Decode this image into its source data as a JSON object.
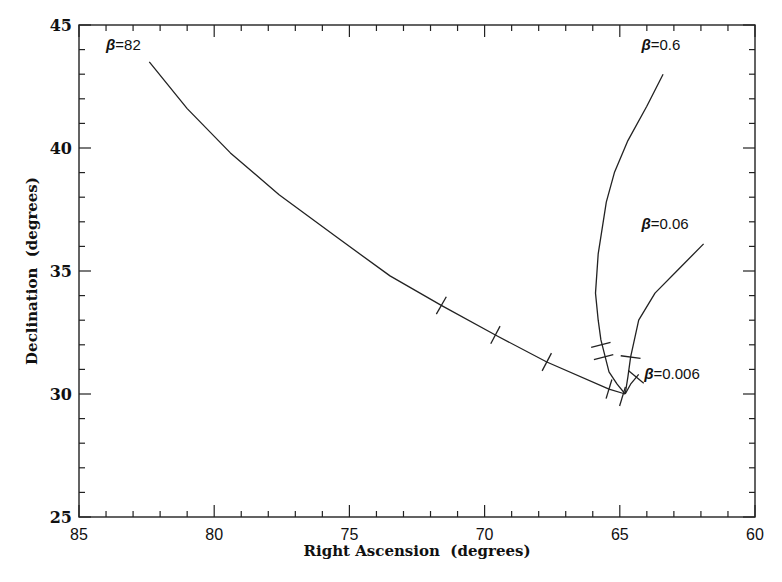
{
  "chart_data": {
    "type": "line",
    "title": "",
    "xlabel": "Right Ascension  (degrees)",
    "ylabel": "Declination  (degrees)",
    "xlim": [
      85,
      60
    ],
    "ylim": [
      25,
      45
    ],
    "x_reversed": true,
    "grid": false,
    "legend": "none (curves labeled inline)",
    "x_ticks": [
      85,
      80,
      75,
      70,
      65,
      60
    ],
    "x_tick_labels": [
      "85",
      "80",
      "75",
      "70",
      "65",
      "60"
    ],
    "y_ticks": [
      25,
      30,
      35,
      40,
      45
    ],
    "y_tick_labels": [
      "25",
      "30",
      "35",
      "40",
      "45"
    ],
    "x_minor_step": 1,
    "y_minor_step": 1,
    "series": [
      {
        "name": "β=82",
        "label_pos": [
          84.0,
          44.2
        ],
        "x": [
          82.4,
          81.0,
          79.4,
          77.6,
          75.5,
          73.5,
          71.6,
          69.6,
          67.7,
          65.4,
          64.8
        ],
        "y": [
          43.5,
          41.6,
          39.8,
          38.1,
          36.4,
          34.8,
          33.6,
          32.4,
          31.3,
          30.2,
          30.0
        ],
        "markers": [
          [
            71.6,
            33.6
          ],
          [
            69.6,
            32.4
          ],
          [
            67.7,
            31.3
          ],
          [
            65.4,
            30.2
          ],
          [
            64.9,
            29.9
          ]
        ]
      },
      {
        "name": "β=0.6",
        "label_pos": [
          64.2,
          44.2
        ],
        "x": [
          63.4,
          64.0,
          64.7,
          65.2,
          65.5,
          65.8,
          65.9,
          65.8,
          65.7,
          65.4,
          65.1,
          64.8
        ],
        "y": [
          43.0,
          41.7,
          40.3,
          39.0,
          37.8,
          35.7,
          34.1,
          33.0,
          32.2,
          30.9,
          30.4,
          30.0
        ],
        "markers": [
          [
            65.7,
            32.0
          ],
          [
            65.6,
            31.5
          ]
        ]
      },
      {
        "name": "β=0.06",
        "label_pos": [
          64.2,
          36.9
        ],
        "x": [
          64.8,
          64.7,
          64.6,
          64.3,
          63.7,
          62.8,
          61.9
        ],
        "y": [
          30.0,
          30.7,
          31.5,
          33.0,
          34.1,
          35.1,
          36.1
        ],
        "markers": [
          [
            64.6,
            31.5
          ]
        ]
      },
      {
        "name": "β=0.006",
        "label_pos": [
          64.1,
          30.8
        ],
        "x": [
          64.8,
          64.6,
          64.3
        ],
        "y": [
          30.0,
          30.4,
          30.8
        ],
        "markers": [
          [
            64.4,
            30.7
          ]
        ]
      }
    ]
  },
  "labels": {
    "xlabel": "Right Ascension  (degrees)",
    "ylabel": "Declination  (degrees)"
  }
}
